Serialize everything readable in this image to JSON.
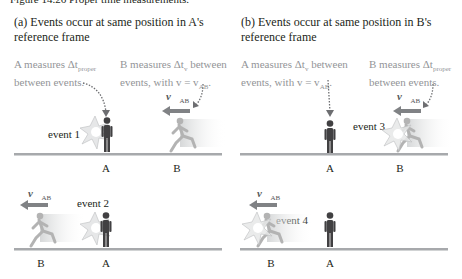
{
  "figure": {
    "caption": "Figure 14.26 Proper time measurements.",
    "colors": {
      "text": "#231f20",
      "note": "#939598",
      "ground": "#a7a9ac",
      "person_a": "#414042",
      "runner_b": "#b3b3b3",
      "arrow": "#808285",
      "burst": "#e6e7e8"
    }
  },
  "panels": [
    {
      "title_line1": "(a) Events occur at same position in A's",
      "title_line2": "reference frame",
      "note_a_line1": "A measures Δt",
      "note_a_sub1": "proper",
      "note_a_line2": "between events.",
      "note_b_line1": "B measures Δt",
      "note_b_sub1": "v",
      "note_b_line1_rest": " between",
      "note_b_line2": "events, with v = v",
      "note_b_sub2": "AB",
      "note_b_line2_rest": ".",
      "scenes": [
        {
          "event_label": "event 1",
          "velocity": "v⃗",
          "velocity_sub": "AB",
          "pos_a": "A",
          "pos_b": "B"
        },
        {
          "event_label": "event 2",
          "velocity": "v⃗",
          "velocity_sub": "AB",
          "pos_a": "A",
          "pos_b": "B"
        }
      ]
    },
    {
      "title_line1": "(b) Events occur at same position in B's",
      "title_line2": "reference frame",
      "note_a_line1": "A measures Δt",
      "note_a_sub1": "v",
      "note_a_line1_rest": " between",
      "note_a_line2": "events, with v = v",
      "note_a_sub2": "AB",
      "note_a_line2_rest": ".",
      "note_b_line1": "B measures Δt",
      "note_b_sub1": "proper",
      "note_b_line2": "between events.",
      "scenes": [
        {
          "event_label": "event 3",
          "velocity": "v⃗",
          "velocity_sub": "AB",
          "pos_a": "A",
          "pos_b": "B"
        },
        {
          "event_label": "event 4",
          "velocity": "v⃗",
          "velocity_sub": "AB",
          "pos_a": "A",
          "pos_b": "B"
        }
      ]
    }
  ]
}
